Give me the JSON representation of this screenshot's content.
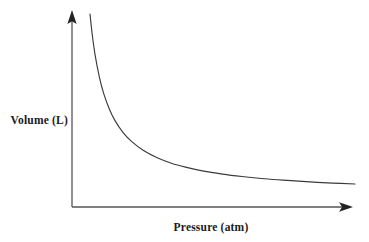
{
  "chart_data": {
    "type": "line",
    "title": "",
    "subtitle": "",
    "xlabel": "Pressure (atm)",
    "ylabel": "Volume (L)",
    "relationship": "inverse",
    "curve_label": "",
    "grid": false,
    "legend": null,
    "axis_ticks": false,
    "tick_labels": [],
    "annotations": [],
    "xlim": [
      0,
      10
    ],
    "ylim": [
      0,
      10
    ],
    "x": [
      0.62,
      0.7,
      0.8,
      0.95,
      1.1,
      1.3,
      1.5,
      1.8,
      2.1,
      2.5,
      3.0,
      3.5,
      4.0,
      4.6,
      5.3,
      6.0,
      6.8,
      7.6,
      8.4,
      9.2,
      10.0
    ],
    "y": [
      9.68,
      8.57,
      7.5,
      6.32,
      5.45,
      4.62,
      4.0,
      3.33,
      2.86,
      2.4,
      2.0,
      1.71,
      1.5,
      1.3,
      1.13,
      1.0,
      0.88,
      0.79,
      0.71,
      0.65,
      0.6
    ],
    "series": [
      {
        "name": "Volume vs Pressure",
        "values": [
          9.68,
          8.57,
          7.5,
          6.32,
          5.45,
          4.62,
          4.0,
          3.33,
          2.86,
          2.4,
          2.0,
          1.71,
          1.5,
          1.3,
          1.13,
          1.0,
          0.88,
          0.79,
          0.71,
          0.65,
          0.6
        ]
      }
    ]
  },
  "colors": {
    "background": "#ffffff",
    "axis": "#555555",
    "curve": "#3b3b3b",
    "label_text": "#1a1a1a"
  },
  "geometry": {
    "origin_x": 72,
    "origin_y": 207,
    "y_axis_top": 20,
    "y_arrow_tip": 10,
    "x_axis_right": 341,
    "x_arrow_tip": 353,
    "curve_start_x": 90,
    "curve_start_y": 14,
    "curve_end_x": 355,
    "curve_end_y": 184
  },
  "labels": {
    "y_axis": "Volume (L)",
    "x_axis": "Pressure (atm)"
  }
}
